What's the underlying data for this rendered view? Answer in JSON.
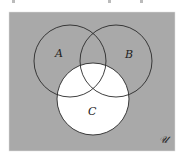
{
  "diagram": {
    "type": "venn",
    "universe": {
      "label": "𝒰",
      "fill": "#a9a9a9",
      "x": 9,
      "y": 12,
      "width": 166,
      "height": 139
    },
    "sets": [
      {
        "name": "A",
        "label": "A",
        "cx": 70,
        "cy": 61,
        "r": 36,
        "label_x": 55,
        "label_y": 57
      },
      {
        "name": "B",
        "label": "B",
        "cx": 116,
        "cy": 61,
        "r": 36,
        "label_x": 125,
        "label_y": 58
      },
      {
        "name": "C",
        "label": "C",
        "cx": 93,
        "cy": 99,
        "r": 36,
        "label_x": 88,
        "label_y": 115
      }
    ],
    "shaded_regions": [
      "U \\ C"
    ],
    "unshaded_regions": [
      "C"
    ],
    "shade_color": "#a9a9a9",
    "unshaded_color": "#ffffff",
    "stroke_color": "#2a2a2a"
  }
}
